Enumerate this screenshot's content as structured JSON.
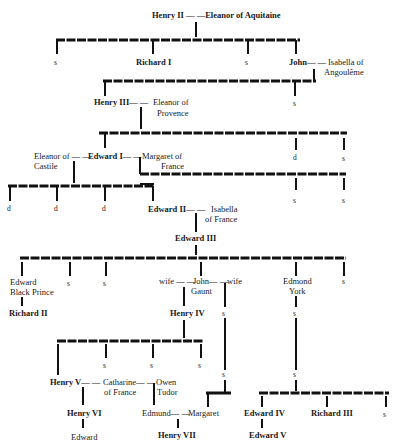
{
  "nodes": {
    "henry2_couple": "Henry II — —Eleanor of Aquitaine",
    "g1_s1": "s",
    "richard1": "Richard I",
    "g1_s2": "s",
    "john": "John— —",
    "isabella_ang_1": "Isabella of",
    "isabella_ang_2": "Angoulême",
    "henry3": "Henry III— —",
    "eleanor_prov_1": "Eleanor of",
    "eleanor_prov_2": "Provence",
    "g2_s": "s",
    "eleanor_cast_1": "Eleanor of — —",
    "eleanor_cast_2": "Castile",
    "edward1": "Edward I— —",
    "margaret_fr_1": "Margaret of",
    "margaret_fr_2": "France",
    "g3_d": "d",
    "g3_s": "s",
    "g4_d1": "d",
    "g4_d2": "d",
    "g4_d3": "d",
    "edward2": "Edward II— —",
    "isabella_fr_1": "Isabella",
    "isabella_fr_2": "of France",
    "g4b_s1": "s",
    "g4b_s2": "s",
    "edward3": "Edward III",
    "black_prince_1": "Edward",
    "black_prince_2": "Black Prince",
    "g5_s1": "s",
    "g5_s2": "s",
    "wife1": "wife — —",
    "john_gaunt_1": "John— —",
    "john_gaunt_2": "Gaunt",
    "wife2": "wife",
    "edmond_1": "Edmond",
    "edmond_2": "York",
    "g5_s3": "s",
    "richard2": "Richard II",
    "henry4": "Henry IV",
    "gaunt_s": "s",
    "york_s": "s",
    "g6_s1": "s",
    "g6_s2": "s",
    "g6_s3": "s",
    "gaunt_s2": "s",
    "york_s2": "s",
    "henry5": "Henry V— —",
    "catharine_1": "Catharine— —",
    "catharine_2": "of France",
    "owen_1": "Owen",
    "owen_2": "Tudor",
    "henry6": "Henry VI",
    "edward_h6": "Edward",
    "edmund": "Edmund— —",
    "margaret": "Margaret",
    "henry7": "Henry VII",
    "edward4": "Edward IV",
    "richard3": "Richard III",
    "g7_s": "s",
    "edward5": "Edward V"
  }
}
